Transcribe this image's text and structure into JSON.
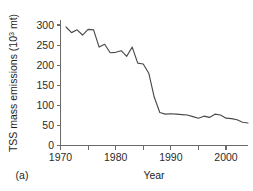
{
  "figure": {
    "panel_label": "(a)",
    "background_color": "#ffffff",
    "line_color": "#4a4a4a",
    "axis_color": "#6b6b6b",
    "text_color": "#1d1d1d"
  },
  "chart_data": {
    "type": "line",
    "title": "",
    "subtitle": "",
    "xlabel": "Year",
    "ylabel_full": "TSS mass emissions (10³ mt)",
    "ylabel_prefix": "TSS mass emissions (10",
    "ylabel_exponent": "3",
    "ylabel_suffix": " mt)",
    "xlim": [
      1970,
      2005
    ],
    "ylim": [
      0,
      310
    ],
    "grid": false,
    "legend": null,
    "legend_position": "none",
    "markers": false,
    "xticks_major": [
      1970,
      1980,
      1990,
      2000
    ],
    "xticks_major_labels": [
      "1970",
      "1980",
      "1990",
      "2000"
    ],
    "xticks_minor": [
      1975,
      1985,
      1995,
      2005
    ],
    "yticks": [
      0,
      50,
      100,
      150,
      200,
      250,
      300
    ],
    "ytick_labels": [
      "0",
      "50",
      "100",
      "150",
      "200",
      "250",
      "300"
    ],
    "series": [
      {
        "name": "TSS mass emissions",
        "x": [
          1971,
          1972,
          1973,
          1974,
          1975,
          1976,
          1977,
          1978,
          1979,
          1980,
          1981,
          1982,
          1983,
          1984,
          1985,
          1986,
          1987,
          1988,
          1989,
          1990,
          1991,
          1992,
          1993,
          1994,
          1995,
          1996,
          1997,
          1998,
          1999,
          2000,
          2001,
          2002,
          2003,
          2004
        ],
        "values": [
          295,
          281,
          288,
          275,
          289,
          288,
          245,
          252,
          231,
          232,
          236,
          222,
          245,
          205,
          203,
          180,
          120,
          82,
          78,
          79,
          78,
          77,
          76,
          72,
          68,
          73,
          70,
          78,
          76,
          68,
          67,
          64,
          58,
          56
        ]
      }
    ]
  }
}
